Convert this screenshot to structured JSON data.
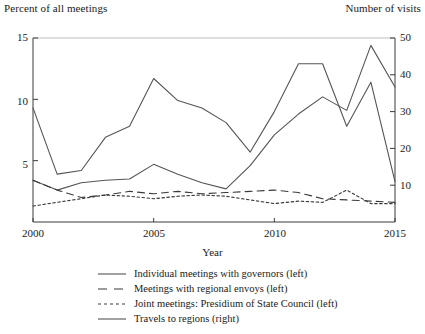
{
  "figure": {
    "header_left": "Percent of all meetings",
    "header_right": "Number of visits"
  },
  "axes": {
    "x_title": "Year",
    "x_ticks": [
      "2000",
      "2005",
      "2010",
      "2015"
    ],
    "y_left_ticks": [
      "15",
      "10",
      "5"
    ],
    "y_right_ticks": [
      "50",
      "40",
      "30",
      "20",
      "10"
    ]
  },
  "legend": {
    "items": [
      {
        "label": "Individual meetings with governors (left)",
        "style": "solid"
      },
      {
        "label": "Meetings with regional envoys (left)",
        "style": "dashed"
      },
      {
        "label": "Joint meetings: Presidium of State Council (left)",
        "style": "dotted"
      },
      {
        "label": "Travels to regions (right)",
        "style": "solid"
      }
    ]
  },
  "chart_data": {
    "type": "line",
    "title": "",
    "xlabel": "Year",
    "ylabel": "Percent of all meetings",
    "y2label": "Number of visits",
    "x": [
      2000,
      2001,
      2002,
      2003,
      2004,
      2005,
      2006,
      2007,
      2008,
      2009,
      2010,
      2011,
      2012,
      2013,
      2014,
      2015
    ],
    "xlim": [
      2000,
      2015
    ],
    "ylim": [
      0,
      15
    ],
    "y2lim": [
      0,
      50
    ],
    "grid": false,
    "legend_position": "below",
    "series": [
      {
        "name": "Individual meetings with governors (left)",
        "axis": "left",
        "style": "solid",
        "color": "#555555",
        "values": [
          3.4,
          2.6,
          3.2,
          3.4,
          3.5,
          4.7,
          3.9,
          3.2,
          2.7,
          4.6,
          7.1,
          8.8,
          10.2,
          9.1,
          14.4,
          11.0
        ]
      },
      {
        "name": "Meetings with regional envoys (left)",
        "axis": "left",
        "style": "dashed",
        "color": "#3a3a3a",
        "values": [
          3.4,
          2.6,
          2.0,
          2.2,
          2.5,
          2.3,
          2.5,
          2.3,
          2.4,
          2.5,
          2.6,
          2.4,
          1.9,
          1.8,
          1.7,
          1.6
        ]
      },
      {
        "name": "Joint meetings: Presidium of State Council (left)",
        "axis": "left",
        "style": "dotted",
        "color": "#3a3a3a",
        "values": [
          1.3,
          1.6,
          1.9,
          2.2,
          2.1,
          1.9,
          2.1,
          2.2,
          2.1,
          1.8,
          1.5,
          1.7,
          1.6,
          2.6,
          1.5,
          1.5
        ]
      },
      {
        "name": "Travels to regions (right)",
        "axis": "right",
        "style": "solid",
        "color": "#555555",
        "values": [
          31,
          13,
          14,
          23,
          26,
          39,
          33,
          31,
          27,
          19,
          30,
          43,
          43,
          26,
          38,
          11
        ]
      }
    ]
  }
}
